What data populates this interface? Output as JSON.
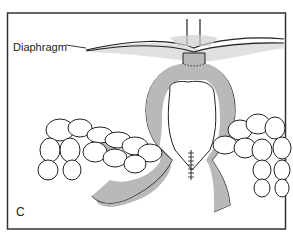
{
  "figure": {
    "panel_letter": "C",
    "labels": {
      "diaphragm": "Diaphragm"
    },
    "colors": {
      "organ_fill": "#b9b9b9",
      "outline": "#222222",
      "shadow": "#d6d6d6",
      "border": "#333333",
      "background": "#ffffff"
    }
  }
}
